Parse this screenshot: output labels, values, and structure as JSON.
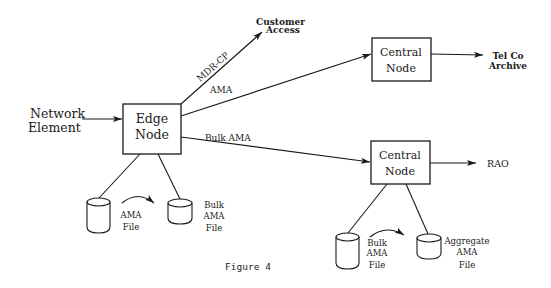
{
  "figure": {
    "caption": "Figure 4",
    "colors": {
      "ink": "#1a1a1a",
      "background": "#ffffff"
    }
  },
  "nodes": {
    "network_element": {
      "line1": "Network",
      "line2": "Element"
    },
    "edge_node": {
      "line1": "Edge",
      "line2": "Node"
    },
    "central_node_top": {
      "line1": "Central",
      "line2": "Node"
    },
    "central_node_bottom": {
      "line1": "Central",
      "line2": "Node"
    }
  },
  "destinations": {
    "customer_access": {
      "line1": "Customer",
      "line2": "Access"
    },
    "telco_archive": {
      "line1": "Tel Co",
      "line2": "Archive"
    },
    "rao": {
      "line1": "RAO"
    }
  },
  "edges": {
    "mdr_cp": "MDR-CP",
    "ama": "AMA",
    "bulk_ama": "Bulk AMA"
  },
  "files": {
    "edge_ama_file": {
      "line1": "AMA",
      "line2": "File"
    },
    "edge_bulk_ama_file": {
      "line1": "Bulk",
      "line2": "AMA",
      "line3": "File"
    },
    "central_bulk_ama_file": {
      "line1": "Bulk",
      "line2": "AMA",
      "line3": "File"
    },
    "central_aggregate_ama_file": {
      "line1": "Aggregate",
      "line2": "AMA",
      "line3": "File"
    }
  }
}
